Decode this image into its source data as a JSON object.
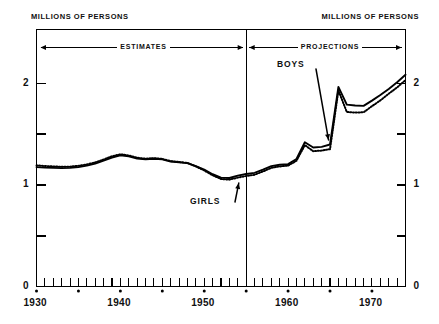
{
  "figure": {
    "axis_title_left": "MILLIONS OF PERSONS",
    "axis_title_right": "MILLIONS OF PERSONS",
    "band_estimates": "ESTIMATES",
    "band_projections": "PROJECTIONS",
    "label_boys": "BOYS",
    "label_girls": "GIRLS",
    "line_color": "#000000",
    "background_color": "#ffffff"
  },
  "chart_data": {
    "type": "line",
    "title": "",
    "subtitle": "",
    "xlabel": "",
    "ylabel": "MILLIONS OF PERSONS",
    "ylabel_right": "MILLIONS OF PERSONS",
    "xlim": [
      1930,
      1974
    ],
    "ylim": [
      0,
      2.53
    ],
    "grid": false,
    "legend": "annotation-arrows",
    "y_ticks_major": [
      0,
      1,
      2
    ],
    "y_tick_labels": [
      "0",
      "1",
      "2"
    ],
    "y_ticks_minor": [
      0.5,
      1.5
    ],
    "x_ticks_major": [
      1930,
      1940,
      1950,
      1960,
      1970
    ],
    "x_tick_labels": [
      "1930",
      "1940",
      "1950",
      "1960",
      "1970"
    ],
    "x_ticks_minor_step": 1,
    "x_dot_markers": [
      1930,
      1935,
      1940,
      1945,
      1950,
      1955,
      1960,
      1965,
      1970
    ],
    "divider_x": 1955,
    "bands": [
      {
        "label": "ESTIMATES",
        "from": 1930,
        "to": 1955
      },
      {
        "label": "PROJECTIONS",
        "from": 1955,
        "to": 1974
      }
    ],
    "x": [
      1930,
      1931,
      1932,
      1933,
      1934,
      1935,
      1936,
      1937,
      1938,
      1939,
      1940,
      1941,
      1942,
      1943,
      1944,
      1945,
      1946,
      1947,
      1948,
      1949,
      1950,
      1951,
      1952,
      1953,
      1954,
      1955,
      1956,
      1957,
      1958,
      1959,
      1960,
      1961,
      1962,
      1963,
      1964,
      1965,
      1966,
      1967,
      1968,
      1969,
      1970,
      1971,
      1972,
      1973,
      1974
    ],
    "series": [
      {
        "name": "BOYS",
        "style": "solid",
        "values": [
          1.175,
          1.17,
          1.168,
          1.165,
          1.168,
          1.175,
          1.19,
          1.21,
          1.24,
          1.27,
          1.292,
          1.282,
          1.26,
          1.252,
          1.258,
          1.252,
          1.23,
          1.222,
          1.215,
          1.185,
          1.15,
          1.105,
          1.072,
          1.068,
          1.092,
          1.108,
          1.118,
          1.15,
          1.185,
          1.198,
          1.205,
          1.255,
          1.42,
          1.368,
          1.375,
          1.398,
          1.965,
          1.79,
          1.782,
          1.778,
          1.83,
          1.885,
          1.945,
          2.01,
          2.085
        ]
      },
      {
        "name": "GIRLS",
        "style": "dotted",
        "values": [
          1.192,
          1.186,
          1.182,
          1.178,
          1.18,
          1.188,
          1.202,
          1.222,
          1.25,
          1.282,
          1.302,
          1.29,
          1.268,
          1.258,
          1.264,
          1.256,
          1.234,
          1.226,
          1.216,
          1.182,
          1.142,
          1.095,
          1.058,
          1.052,
          1.072,
          1.088,
          1.1,
          1.132,
          1.168,
          1.182,
          1.19,
          1.238,
          1.392,
          1.332,
          1.338,
          1.352,
          1.93,
          1.718,
          1.712,
          1.715,
          1.775,
          1.832,
          1.898,
          1.96,
          2.032
        ]
      }
    ],
    "annotations": [
      {
        "text": "BOYS",
        "points_to_series": "BOYS",
        "points_to_x": 1965
      },
      {
        "text": "GIRLS",
        "points_to_series": "GIRLS",
        "points_to_x": 1954
      }
    ]
  }
}
